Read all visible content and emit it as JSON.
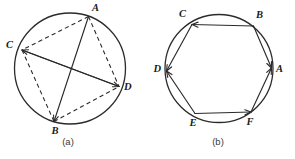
{
  "figure": {
    "background_color": "#ffffff",
    "ink_color": "#2b2b2b",
    "width": 295,
    "height": 159
  },
  "panels": [
    {
      "id": "panel-a",
      "caption": "(a)",
      "caption_position": {
        "x": 68,
        "y": 145
      },
      "circle": {
        "cx": 70,
        "cy": 68.5,
        "r": 55.5
      },
      "vertices": [
        {
          "name": "A",
          "label": "A",
          "x": 88.5,
          "y": 16.5,
          "label_x": 92,
          "label_y": 11,
          "anchor": "start"
        },
        {
          "name": "C",
          "label": "C",
          "x": 22.0,
          "y": 50.0,
          "label_x": 13,
          "label_y": 48,
          "anchor": "end"
        },
        {
          "name": "B",
          "label": "B",
          "x": 54.0,
          "y": 121.5,
          "label_x": 55,
          "label_y": 134,
          "anchor": "middle"
        },
        {
          "name": "D",
          "label": "D",
          "x": 119.0,
          "y": 86.5,
          "label_x": 124,
          "label_y": 90,
          "anchor": "start"
        }
      ],
      "solid_edges": [
        {
          "name": "chord-A-B",
          "from": "A",
          "to": "B",
          "arrow_at": "B"
        },
        {
          "name": "chord-D-C",
          "from": "D",
          "to": "C",
          "arrow_at": "C"
        },
        {
          "name": "chord-C-D",
          "from": "C",
          "to": "D",
          "arrow_at": "D"
        }
      ],
      "dashed_edges": [
        {
          "name": "dashed-A-C",
          "from": "A",
          "to": "C"
        },
        {
          "name": "dashed-A-D",
          "from": "A",
          "to": "D"
        },
        {
          "name": "dashed-C-B",
          "from": "C",
          "to": "B"
        },
        {
          "name": "dashed-B-D",
          "from": "B",
          "to": "D"
        }
      ],
      "line_style_note": "quadrilateral sides dashed, diagonals solid with arrowheads"
    },
    {
      "id": "panel-b",
      "caption": "(b)",
      "caption_position": {
        "x": 218,
        "y": 145
      },
      "circle": {
        "cx": 219,
        "cy": 68.5,
        "r": 54.0
      },
      "vertices": [
        {
          "name": "B",
          "label": "B",
          "x": 253.5,
          "y": 26.0,
          "label_x": 256,
          "label_y": 18,
          "anchor": "start"
        },
        {
          "name": "C",
          "label": "C",
          "x": 192.0,
          "y": 24.5,
          "label_x": 186,
          "label_y": 17,
          "anchor": "end"
        },
        {
          "name": "D",
          "label": "D",
          "x": 166.5,
          "y": 71.0,
          "label_x": 161,
          "label_y": 72,
          "anchor": "end"
        },
        {
          "name": "E",
          "label": "E",
          "x": 195.0,
          "y": 113.5,
          "label_x": 193,
          "label_y": 126,
          "anchor": "middle"
        },
        {
          "name": "F",
          "label": "F",
          "x": 251.0,
          "y": 112.0,
          "label_x": 250,
          "label_y": 125,
          "anchor": "middle"
        },
        {
          "name": "A",
          "label": "A",
          "x": 271.5,
          "y": 68.0,
          "label_x": 276,
          "label_y": 72,
          "anchor": "start"
        }
      ],
      "directed_edges": [
        {
          "name": "edge-B-to-C",
          "from": "B",
          "to": "C",
          "arrow_at": "C"
        },
        {
          "name": "edge-C-to-D",
          "from": "C",
          "to": "D",
          "arrow_at": "D"
        },
        {
          "name": "edge-E-to-D",
          "from": "E",
          "to": "D",
          "arrow_at": "D"
        },
        {
          "name": "edge-E-to-F",
          "from": "E",
          "to": "F",
          "arrow_at": "F"
        },
        {
          "name": "edge-F-to-A",
          "from": "F",
          "to": "A",
          "arrow_at": "A"
        },
        {
          "name": "edge-B-to-A",
          "from": "B",
          "to": "A",
          "arrow_at": "A"
        }
      ],
      "line_style_note": "hexagon sides solid with arrowheads; all arrows point toward A and D"
    }
  ]
}
